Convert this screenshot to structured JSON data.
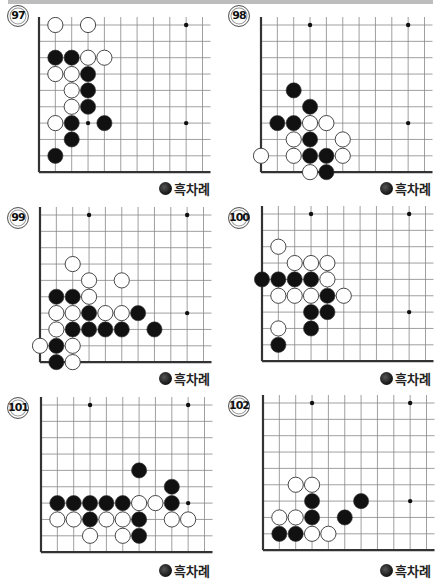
{
  "page": {
    "top_bar_color": "#bdbdbd"
  },
  "legend_label": "흑차례",
  "problems": [
    {
      "number": "97",
      "caption": "흑차례",
      "stones": [
        {
          "c": "w",
          "x": 1,
          "y": 0
        },
        {
          "c": "w",
          "x": 3,
          "y": 0
        },
        {
          "c": "b",
          "x": 1,
          "y": 2
        },
        {
          "c": "b",
          "x": 2,
          "y": 2
        },
        {
          "c": "w",
          "x": 3,
          "y": 2
        },
        {
          "c": "w",
          "x": 4,
          "y": 2
        },
        {
          "c": "w",
          "x": 1,
          "y": 3
        },
        {
          "c": "w",
          "x": 2,
          "y": 3
        },
        {
          "c": "b",
          "x": 3,
          "y": 3
        },
        {
          "c": "w",
          "x": 2,
          "y": 4
        },
        {
          "c": "b",
          "x": 3,
          "y": 4
        },
        {
          "c": "w",
          "x": 2,
          "y": 5
        },
        {
          "c": "b",
          "x": 3,
          "y": 5
        },
        {
          "c": "w",
          "x": 1,
          "y": 6
        },
        {
          "c": "b",
          "x": 2,
          "y": 6
        },
        {
          "c": "b",
          "x": 4,
          "y": 6
        },
        {
          "c": "b",
          "x": 2,
          "y": 7
        },
        {
          "c": "b",
          "x": 1,
          "y": 8
        }
      ]
    },
    {
      "number": "98",
      "caption": "흑차례",
      "stones": [
        {
          "c": "b",
          "x": 2,
          "y": 4
        },
        {
          "c": "b",
          "x": 3,
          "y": 5
        },
        {
          "c": "b",
          "x": 1,
          "y": 6
        },
        {
          "c": "b",
          "x": 2,
          "y": 6
        },
        {
          "c": "w",
          "x": 3,
          "y": 6
        },
        {
          "c": "w",
          "x": 4,
          "y": 6
        },
        {
          "c": "w",
          "x": 2,
          "y": 7
        },
        {
          "c": "b",
          "x": 3,
          "y": 7
        },
        {
          "c": "w",
          "x": 5,
          "y": 7
        },
        {
          "c": "w",
          "x": 0,
          "y": 8
        },
        {
          "c": "w",
          "x": 2,
          "y": 8
        },
        {
          "c": "b",
          "x": 3,
          "y": 8
        },
        {
          "c": "b",
          "x": 4,
          "y": 8
        },
        {
          "c": "w",
          "x": 5,
          "y": 8
        },
        {
          "c": "w",
          "x": 3,
          "y": 9
        },
        {
          "c": "b",
          "x": 4,
          "y": 9
        }
      ]
    },
    {
      "number": "99",
      "caption": "흑차례",
      "stones": [
        {
          "c": "w",
          "x": 2,
          "y": 3
        },
        {
          "c": "w",
          "x": 3,
          "y": 4
        },
        {
          "c": "w",
          "x": 5,
          "y": 4
        },
        {
          "c": "b",
          "x": 1,
          "y": 5
        },
        {
          "c": "b",
          "x": 2,
          "y": 5
        },
        {
          "c": "w",
          "x": 3,
          "y": 5
        },
        {
          "c": "w",
          "x": 1,
          "y": 6
        },
        {
          "c": "w",
          "x": 2,
          "y": 6
        },
        {
          "c": "b",
          "x": 3,
          "y": 6
        },
        {
          "c": "w",
          "x": 4,
          "y": 6
        },
        {
          "c": "w",
          "x": 5,
          "y": 6
        },
        {
          "c": "b",
          "x": 6,
          "y": 6
        },
        {
          "c": "w",
          "x": 1,
          "y": 7
        },
        {
          "c": "b",
          "x": 2,
          "y": 7
        },
        {
          "c": "b",
          "x": 3,
          "y": 7
        },
        {
          "c": "b",
          "x": 4,
          "y": 7
        },
        {
          "c": "b",
          "x": 5,
          "y": 7
        },
        {
          "c": "b",
          "x": 7,
          "y": 7
        },
        {
          "c": "w",
          "x": 0,
          "y": 8
        },
        {
          "c": "b",
          "x": 1,
          "y": 8
        },
        {
          "c": "w",
          "x": 2,
          "y": 8
        },
        {
          "c": "b",
          "x": 1,
          "y": 9
        },
        {
          "c": "w",
          "x": 2,
          "y": 9
        }
      ]
    },
    {
      "number": "100",
      "caption": "흑차례",
      "stones": [
        {
          "c": "w",
          "x": 1,
          "y": 2
        },
        {
          "c": "w",
          "x": 2,
          "y": 3
        },
        {
          "c": "w",
          "x": 3,
          "y": 3
        },
        {
          "c": "w",
          "x": 4,
          "y": 3
        },
        {
          "c": "b",
          "x": 0,
          "y": 4
        },
        {
          "c": "b",
          "x": 1,
          "y": 4
        },
        {
          "c": "b",
          "x": 2,
          "y": 4
        },
        {
          "c": "b",
          "x": 3,
          "y": 4
        },
        {
          "c": "w",
          "x": 4,
          "y": 4
        },
        {
          "c": "w",
          "x": 1,
          "y": 5
        },
        {
          "c": "w",
          "x": 2,
          "y": 5
        },
        {
          "c": "w",
          "x": 3,
          "y": 5
        },
        {
          "c": "b",
          "x": 4,
          "y": 5
        },
        {
          "c": "w",
          "x": 5,
          "y": 5
        },
        {
          "c": "b",
          "x": 3,
          "y": 6
        },
        {
          "c": "b",
          "x": 4,
          "y": 6
        },
        {
          "c": "w",
          "x": 1,
          "y": 7
        },
        {
          "c": "b",
          "x": 3,
          "y": 7
        },
        {
          "c": "b",
          "x": 1,
          "y": 8
        }
      ]
    },
    {
      "number": "101",
      "caption": "흑차례",
      "stones": [
        {
          "c": "b",
          "x": 6,
          "y": 4
        },
        {
          "c": "b",
          "x": 8,
          "y": 5
        },
        {
          "c": "b",
          "x": 1,
          "y": 6
        },
        {
          "c": "b",
          "x": 2,
          "y": 6
        },
        {
          "c": "b",
          "x": 3,
          "y": 6
        },
        {
          "c": "b",
          "x": 4,
          "y": 6
        },
        {
          "c": "b",
          "x": 5,
          "y": 6
        },
        {
          "c": "w",
          "x": 6,
          "y": 6
        },
        {
          "c": "w",
          "x": 7,
          "y": 6
        },
        {
          "c": "b",
          "x": 8,
          "y": 6
        },
        {
          "c": "w",
          "x": 1,
          "y": 7
        },
        {
          "c": "w",
          "x": 2,
          "y": 7
        },
        {
          "c": "b",
          "x": 3,
          "y": 7
        },
        {
          "c": "w",
          "x": 4,
          "y": 7
        },
        {
          "c": "w",
          "x": 5,
          "y": 7
        },
        {
          "c": "b",
          "x": 6,
          "y": 7
        },
        {
          "c": "w",
          "x": 8,
          "y": 7
        },
        {
          "c": "w",
          "x": 9,
          "y": 7
        },
        {
          "c": "w",
          "x": 3,
          "y": 8
        },
        {
          "c": "w",
          "x": 5,
          "y": 8
        },
        {
          "c": "b",
          "x": 6,
          "y": 8
        }
      ]
    },
    {
      "number": "102",
      "caption": "흑차례",
      "stones": [
        {
          "c": "w",
          "x": 2,
          "y": 5
        },
        {
          "c": "w",
          "x": 3,
          "y": 5
        },
        {
          "c": "b",
          "x": 3,
          "y": 6
        },
        {
          "c": "b",
          "x": 6,
          "y": 6
        },
        {
          "c": "w",
          "x": 1,
          "y": 7
        },
        {
          "c": "w",
          "x": 2,
          "y": 7
        },
        {
          "c": "b",
          "x": 3,
          "y": 7
        },
        {
          "c": "b",
          "x": 5,
          "y": 7
        },
        {
          "c": "b",
          "x": 1,
          "y": 8
        },
        {
          "c": "b",
          "x": 2,
          "y": 8
        },
        {
          "c": "w",
          "x": 3,
          "y": 8
        },
        {
          "c": "w",
          "x": 4,
          "y": 8
        }
      ]
    }
  ],
  "board": {
    "spacing": 16.35,
    "cols": 11,
    "rows": 9,
    "star_points": [
      {
        "x": 3,
        "y": 0
      },
      {
        "x": 9,
        "y": 0
      },
      {
        "x": 3,
        "y": 6
      },
      {
        "x": 9,
        "y": 6
      }
    ],
    "colors": {
      "line": "#888888",
      "edge": "#333333",
      "black_stone": "#111111",
      "white_stone": "#ffffff",
      "stone_border": "#333333"
    }
  }
}
